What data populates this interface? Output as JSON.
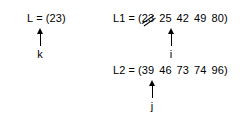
{
  "diagram": {
    "type": "pointer-diagram",
    "background_color": "#ffffff",
    "text_color": "#000000",
    "groups": [
      {
        "id": "L",
        "name": "L",
        "equals": "=",
        "open_paren": "(",
        "close_paren": ")",
        "elements": [
          {
            "value": "23",
            "struck": false
          }
        ],
        "pointer": {
          "label": "k",
          "target_value": "23",
          "target_index": 0,
          "direction": "up"
        }
      },
      {
        "id": "L1",
        "name": "L1",
        "equals": "=",
        "open_paren": "(",
        "close_paren": ")",
        "elements": [
          {
            "value": "23",
            "struck": true
          },
          {
            "value": "25",
            "struck": false
          },
          {
            "value": "42",
            "struck": false
          },
          {
            "value": "49",
            "struck": false
          },
          {
            "value": "80",
            "struck": false
          }
        ],
        "pointer": {
          "label": "i",
          "target_value": "25",
          "target_index": 1,
          "direction": "up"
        }
      },
      {
        "id": "L2",
        "name": "L2",
        "equals": "=",
        "open_paren": "(",
        "close_paren": ")",
        "elements": [
          {
            "value": "39",
            "struck": false
          },
          {
            "value": "46",
            "struck": false
          },
          {
            "value": "73",
            "struck": false
          },
          {
            "value": "74",
            "struck": false
          },
          {
            "value": "96",
            "struck": false
          }
        ],
        "pointer": {
          "label": "j",
          "target_value": "39",
          "target_index": 0,
          "direction": "up"
        }
      }
    ]
  }
}
